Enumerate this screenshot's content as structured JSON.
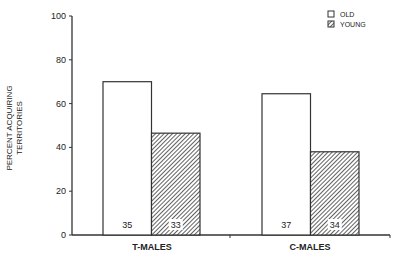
{
  "chart_data": {
    "type": "bar",
    "title": "",
    "xlabel": "",
    "ylabel": "PERCENT ACQUIRING TERRITORIES",
    "ylabel_lines": [
      "PERCENT ACQUIRING",
      "TERRITORIES"
    ],
    "ylim": [
      0,
      100
    ],
    "yticks": [
      "0",
      "20",
      "40",
      "60",
      "80",
      "100"
    ],
    "grid": false,
    "legend_position": "top-right",
    "categories": [
      "T-MALES",
      "C-MALES"
    ],
    "series": [
      {
        "name": "OLD",
        "fill": "white",
        "values": [
          70,
          64.5
        ],
        "sample_sizes": [
          "35",
          "37"
        ]
      },
      {
        "name": "YOUNG",
        "fill": "hatched",
        "values": [
          46.5,
          38
        ],
        "sample_sizes": [
          "33",
          "34"
        ]
      }
    ]
  },
  "colors": {
    "stroke": "#333333",
    "hatch": "#444444",
    "background": "#ffffff"
  }
}
